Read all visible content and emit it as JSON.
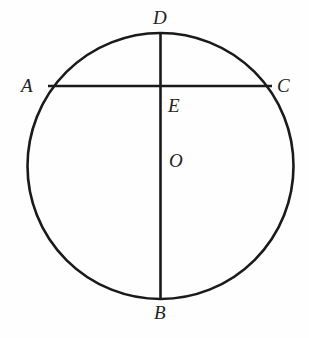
{
  "figure": {
    "type": "geometry-diagram",
    "background_color": "#fefefe",
    "stroke_color": "#1a1a1a",
    "label_color": "#231f20"
  },
  "circle": {
    "name": "circle-O",
    "center_x": 160.5,
    "center_y": 166,
    "radius": 133,
    "stroke_width": 2.6
  },
  "segments": [
    {
      "name": "diameter-DB",
      "from": "D",
      "to": "B",
      "x1": 160.5,
      "y1": 33,
      "x2": 160.5,
      "y2": 298,
      "stroke_width": 2.6
    },
    {
      "name": "chord-AC",
      "from": "A",
      "to": "C",
      "x1": 48,
      "y1": 86,
      "x2": 272,
      "y2": 86,
      "stroke_width": 2.6
    }
  ],
  "labels": {
    "D": {
      "text": "D",
      "x": 153,
      "y": 8
    },
    "A": {
      "text": "A",
      "x": 21,
      "y": 76
    },
    "C": {
      "text": "C",
      "x": 277,
      "y": 76
    },
    "E": {
      "text": "E",
      "x": 168,
      "y": 96
    },
    "O": {
      "text": "O",
      "x": 169,
      "y": 151
    },
    "B": {
      "text": "B",
      "x": 154,
      "y": 303
    }
  },
  "chart_data": {
    "type": "diagram",
    "points": [
      {
        "id": "D",
        "label": "D",
        "x": 160.5,
        "y": 33,
        "role": "top-of-circle"
      },
      {
        "id": "B",
        "label": "B",
        "x": 160.5,
        "y": 298,
        "role": "bottom-of-circle"
      },
      {
        "id": "A",
        "label": "A",
        "x": 48,
        "y": 86,
        "role": "chord-endpoint-left"
      },
      {
        "id": "C",
        "label": "C",
        "x": 272,
        "y": 86,
        "role": "chord-endpoint-right"
      },
      {
        "id": "E",
        "label": "E",
        "x": 160.5,
        "y": 86,
        "role": "intersection"
      },
      {
        "id": "O",
        "label": "O",
        "x": 160.5,
        "y": 166,
        "role": "center"
      }
    ]
  }
}
